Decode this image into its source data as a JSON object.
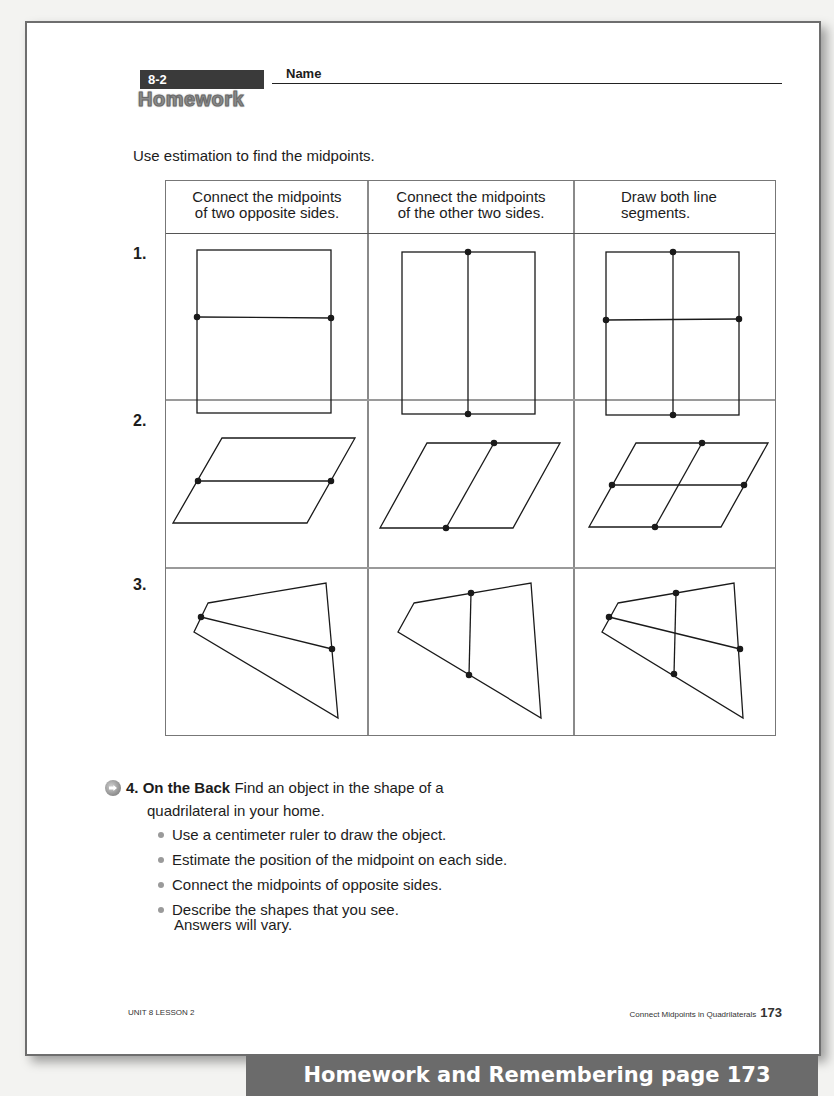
{
  "header": {
    "lesson_badge": "8-2",
    "title": "Homework",
    "name_label": "Name"
  },
  "instructions": "Use estimation to find the midpoints.",
  "table": {
    "columns": [
      "Connect the midpoints of two opposite sides.",
      "Connect the midpoints of the other two sides.",
      "Draw both line segments."
    ],
    "column_lines": [
      [
        "Connect the midpoints",
        "of two opposite sides."
      ],
      [
        "Connect the midpoints",
        "of the other two sides."
      ],
      [
        "Draw both line",
        "segments."
      ]
    ],
    "rows": [
      {
        "number": "1.",
        "shape": "rectangle"
      },
      {
        "number": "2.",
        "shape": "parallelogram"
      },
      {
        "number": "3.",
        "shape": "quadrilateral"
      }
    ]
  },
  "item4": {
    "icon": "arrow-circle-icon",
    "number": "4.",
    "bold_label": "On the Back",
    "text": "Find an object in the shape of a",
    "text_line2": "quadrilateral in your home.",
    "bullets": [
      "Use a centimeter ruler to draw the object.",
      "Estimate the position of the midpoint on each side.",
      "Connect the midpoints of opposite sides.",
      "Describe the shapes that you see."
    ],
    "answer_note": "Answers will vary."
  },
  "footer": {
    "left": "UNIT 8 LESSON 2",
    "right": "Connect Midpoints in Quadrilaterals",
    "page_number": "173"
  },
  "banner": "Homework and Remembering page 173"
}
